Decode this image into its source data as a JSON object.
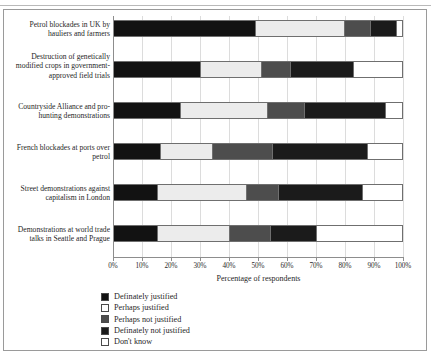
{
  "chart_data": {
    "type": "bar",
    "subtype": "stacked-horizontal-100-percent",
    "title": "",
    "xlabel": "Percentage of respondents",
    "ylabel": "",
    "xlim": [
      0,
      100
    ],
    "xticks": [
      "0%",
      "10%",
      "20%",
      "30%",
      "40%",
      "50%",
      "60%",
      "70%",
      "80%",
      "90%",
      "100%"
    ],
    "grid": true,
    "legend_position": "bottom-left",
    "categories": [
      "Petrol blockades in UK by hauliers and farmers",
      "Destruction of genetically modified crops in government-approved field trials",
      "Countryside Alliance and pro-hunting demonstrations",
      "French blockades at ports over petrol",
      "Street demonstrations against capitalism in London",
      "Demonstrations at world trade talks in Seattle and Prague"
    ],
    "series": [
      {
        "name": "Definately justified",
        "color": "#121212",
        "values": [
          49,
          30,
          23,
          16,
          15,
          15
        ]
      },
      {
        "name": "Perhaps justified",
        "color": "#ececec",
        "values": [
          31,
          21,
          30,
          18,
          31,
          25
        ]
      },
      {
        "name": "Perhaps not justified",
        "color": "#4d4d4d",
        "values": [
          9,
          10,
          13,
          21,
          11,
          14
        ]
      },
      {
        "name": "Definately not justified",
        "color": "#1b1b1b",
        "values": [
          9,
          22,
          28,
          33,
          29,
          16
        ]
      },
      {
        "name": "Don't know",
        "color": "#ffffff",
        "values": [
          2,
          17,
          6,
          12,
          14,
          30
        ]
      }
    ]
  },
  "axis": {
    "x_title": "Percentage of respondents"
  },
  "legend": {
    "items": [
      {
        "label": "Definately justified",
        "swatch": "#121212"
      },
      {
        "label": "Perhaps justified",
        "swatch": "#ffffff"
      },
      {
        "label": "Perhaps not justified",
        "swatch": "#4d4d4d"
      },
      {
        "label": "Definately not justified",
        "swatch": "#1b1b1b"
      },
      {
        "label": "Don't know",
        "swatch": "#ffffff"
      }
    ]
  }
}
